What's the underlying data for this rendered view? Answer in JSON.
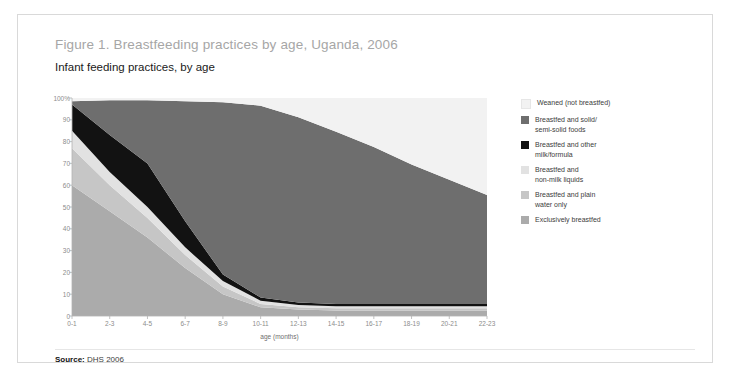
{
  "figure": {
    "title": "Figure 1. Breastfeeding practices by age, Uganda, 2006",
    "subtitle": "Infant feeding practices, by age",
    "source_label": "Source:",
    "source_value": "DHS 2006"
  },
  "colors": {
    "weaned": "#F2F2F2",
    "solid_foods": "#6E6E6E",
    "other_milk": "#121212",
    "non_milk_liquids": "#E2E2E2",
    "plain_water": "#C6C6C6",
    "exclusive": "#ABABAB",
    "axis_text": "#8C8C8C",
    "title_text": "#A6A6A6",
    "card_border": "#D9D9D9"
  },
  "chart_data": {
    "type": "area",
    "stacked": true,
    "title": "Infant feeding practices, by age",
    "xlabel": "age (months)",
    "ylabel": "",
    "ylim": [
      0,
      100
    ],
    "grid": false,
    "legend_position": "right",
    "categories": [
      "0-1",
      "2-3",
      "4-5",
      "6-7",
      "8-9",
      "10-11",
      "12-13",
      "14-15",
      "16-17",
      "18-19",
      "20-21",
      "22-23"
    ],
    "yticks": [
      "0",
      "10",
      "20",
      "30",
      "40",
      "50",
      "60",
      "70",
      "80",
      "90",
      "100%"
    ],
    "series": [
      {
        "name": "Exclusively breastfed",
        "color": "#ABABAB",
        "values": [
          60,
          48,
          36,
          22,
          10,
          4,
          3,
          2.5,
          2.5,
          2.5,
          2.5,
          2.5
        ]
      },
      {
        "name": "Breastfed and plain water only",
        "color": "#C6C6C6",
        "values": [
          17,
          12,
          9,
          6,
          3.5,
          1.5,
          1,
          1,
          1,
          1,
          1,
          1
        ]
      },
      {
        "name": "Breastfed and non-milk liquids",
        "color": "#E2E2E2",
        "values": [
          8,
          6,
          5,
          3.5,
          2.5,
          1.5,
          1,
          1,
          1,
          1,
          1,
          1
        ]
      },
      {
        "name": "Breastfed and other milk/formula",
        "color": "#121212",
        "values": [
          12,
          17,
          20,
          12,
          3,
          1.5,
          1.2,
          1,
          1,
          1,
          1,
          1
        ]
      },
      {
        "name": "Breastfed and solid/semi-solid foods",
        "color": "#6E6E6E",
        "values": [
          1.5,
          16,
          29,
          55,
          79,
          88,
          85,
          79,
          72,
          64,
          57,
          50
        ]
      },
      {
        "name": "Weaned (not breastfed)",
        "color": "#F2F2F2",
        "values": [
          1.5,
          1,
          1,
          1.5,
          2,
          3.5,
          8.8,
          15.5,
          22.5,
          30.5,
          37.5,
          44.5
        ]
      }
    ]
  },
  "legend": {
    "items": [
      {
        "label": "Weaned (not breastfed)",
        "color": "#F2F2F2"
      },
      {
        "label": "Breastfed and solid/\nsemi-solid foods",
        "color": "#6E6E6E"
      },
      {
        "label": "Breastfed and other\nmilk/formula",
        "color": "#121212"
      },
      {
        "label": "Breastfed and\nnon-milk liquids",
        "color": "#E2E2E2"
      },
      {
        "label": "Breastfed and plain\nwater only",
        "color": "#C6C6C6"
      },
      {
        "label": "Exclusively breastfed",
        "color": "#ABABAB"
      }
    ]
  }
}
